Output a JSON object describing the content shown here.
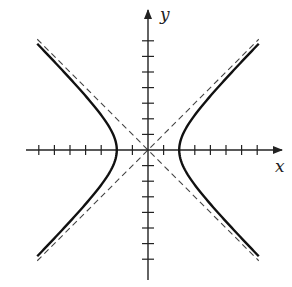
{
  "diagram": {
    "x_label": "x",
    "y_label": "y",
    "origin_px": [
      148,
      150
    ],
    "unit_px": 15.6,
    "x_ticks": [
      -7,
      -6,
      -5,
      -4,
      -3,
      -1,
      1,
      3,
      4,
      5,
      6,
      7
    ],
    "y_ticks": [
      -7,
      -6,
      -5,
      -4,
      -3,
      -2,
      -1,
      1,
      2,
      3,
      4,
      5,
      6,
      7
    ],
    "hyperbola": {
      "equation": "x^2/4 - y^2/4 = 1",
      "a": 2,
      "b": 2,
      "x_extent": 7.1
    },
    "asymptotes": [
      "y = x",
      "y = -x"
    ],
    "colors": {
      "curve": "#111111",
      "axis": "#222222",
      "asymptote": "#444444"
    }
  }
}
